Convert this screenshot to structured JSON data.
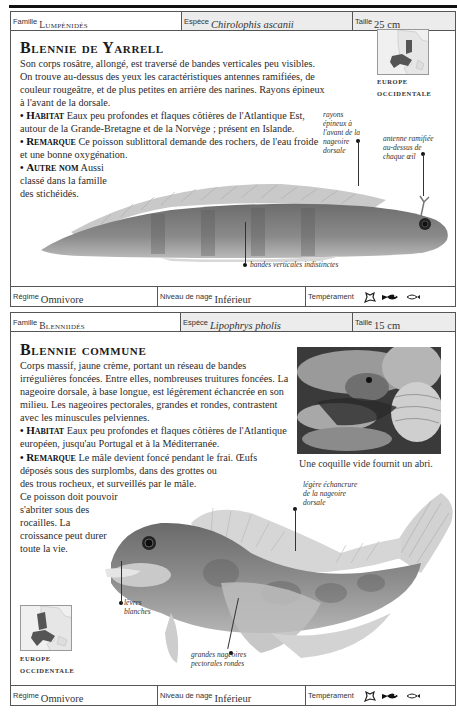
{
  "cards": [
    {
      "header": {
        "famille_label": "Famille",
        "famille_value": "Lumpénidés",
        "espece_label": "Espèce",
        "espece_value": "Chirolophis ascanii",
        "taille_label": "Taille",
        "taille_value": "25 cm"
      },
      "title": "Blennie de Yarrell",
      "description": "Son corps rosâtre, allongé, est traversé de bandes verticales peu visibles. On trouve au-dessus des yeux les caractéristiques antennes ramifiées, de couleur rougeâtre, et de plus petites en arrière des narines. Rayons épineux à l'avant de la dorsale.",
      "sections": [
        {
          "keyword": "Habitat",
          "text": "Eaux peu profondes et flaques côtières de l'Atlantique Est, autour de la Grande-Bretagne et de la Norvège ; présent en Islande."
        },
        {
          "keyword": "Remarque",
          "text": "Ce poisson sublittoral demande des rochers, de l'eau froide et une bonne oxygénation."
        },
        {
          "keyword": "Autre nom",
          "text": "Aussi classé dans la famille des stichéidés."
        }
      ],
      "map": {
        "caption_line1": "EUROPE",
        "caption_line2": "OCCIDENTALE"
      },
      "annotations": [
        "rayons épineux à l'avant de la nageoire dorsale",
        "antenne ramifiée au-dessus de chaque œil",
        "bandes verticales indistinctes"
      ],
      "footer": {
        "regime_label": "Régime",
        "regime_value": "Omnivore",
        "niveau_label": "Niveau de nage",
        "niveau_value": "Inférieur",
        "temperament_label": "Tempérament",
        "temperament_icons": [
          "peaceful-fish-icon",
          "bottom-dwelling-fish-icon",
          "school-fish-icon"
        ]
      }
    },
    {
      "header": {
        "famille_label": "Famille",
        "famille_value": "Blenniidés",
        "espece_label": "Espèce",
        "espece_value": "Lipophrys pholis",
        "taille_label": "Taille",
        "taille_value": "15 cm"
      },
      "title": "Blennie commune",
      "description": "Corps massif, jaune crème, portant un réseau de bandes irrégulières foncées. Entre elles, nombreuses truitures foncées. La nageoire dorsale, à base longue, est légèrement échancrée en son milieu. Les nageoires pectorales, grandes et rondes, contrastent avec les minuscules pelviennes.",
      "sections": [
        {
          "keyword": "Habitat",
          "text": "Eaux peu profondes et flaques côtières de l'Atlantique européen, jusqu'au Portugal et à la Méditerranée."
        },
        {
          "keyword": "Remarque",
          "text": "Le mâle devient foncé pendant le frai. Œufs déposés sous des surplombs, dans des grottes ou des trous rocheux, et surveillés par le mâle. Ce poisson doit pouvoir s'abriter sous des rocailles. La croissance peut durer toute la vie."
        }
      ],
      "photo_caption": "Une coquille vide fournit un abri.",
      "map": {
        "caption_line1": "EUROPE",
        "caption_line2": "OCCIDENTALE"
      },
      "annotations": [
        "légère échancrure de la nageoire dorsale",
        "lèvres blanches",
        "grandes nageoires pectorales rondes"
      ],
      "footer": {
        "regime_label": "Régime",
        "regime_value": "Omnivore",
        "niveau_label": "Niveau de nage",
        "niveau_value": "Inférieur",
        "temperament_label": "Tempérament",
        "temperament_icons": [
          "peaceful-fish-icon",
          "bottom-dwelling-fish-icon",
          "school-fish-icon"
        ]
      }
    }
  ]
}
